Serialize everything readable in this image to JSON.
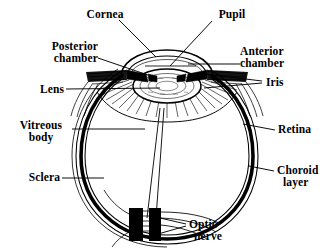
{
  "diagram": {
    "background_color": "#ffffff",
    "ink_color": "#000000",
    "width": 335,
    "height": 248
  },
  "labels": {
    "cornea": "Cornea",
    "pupil": "Pupil",
    "posterior_chamber_line1": "Posterior",
    "posterior_chamber_line2": "chamber",
    "anterior_chamber_line1": "Anterior",
    "anterior_chamber_line2": "chamber",
    "lens": "Lens",
    "iris": "Iris",
    "vitreous_body_line1": "Vitreous",
    "vitreous_body_line2": "body",
    "retina": "Retina",
    "sclera": "Sclera",
    "choroid_layer_line1": "Choroid",
    "choroid_layer_line2": "layer",
    "optic_nerve_line1": "Optic",
    "optic_nerve_line2": "nerve"
  },
  "structures": [
    {
      "name": "cornea",
      "description": "transparent dome at front of eye"
    },
    {
      "name": "pupil",
      "description": "central opening in the iris"
    },
    {
      "name": "posterior-chamber",
      "description": "space behind iris, before lens"
    },
    {
      "name": "anterior-chamber",
      "description": "space between cornea and iris"
    },
    {
      "name": "lens",
      "description": "stippled biconvex lens behind pupil"
    },
    {
      "name": "iris",
      "description": "pigmented diaphragm flanking the pupil"
    },
    {
      "name": "vitreous-body",
      "description": "gel filling the main eyeball cavity"
    },
    {
      "name": "retina",
      "description": "innermost light sensitive layer"
    },
    {
      "name": "sclera",
      "description": "tough outer white coat of the eyeball"
    },
    {
      "name": "choroid-layer",
      "description": "vascular layer between retina and sclera"
    },
    {
      "name": "optic-nerve",
      "description": "nerve bundle exiting at the rear of the globe"
    },
    {
      "name": "ciliary-body",
      "description": "radiating muscle ring supporting the lens"
    }
  ]
}
